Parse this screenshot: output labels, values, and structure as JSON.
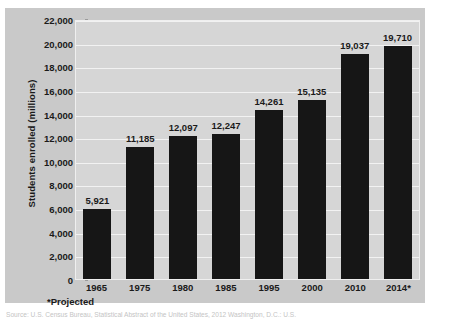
{
  "chart_data": {
    "type": "bar",
    "title": "",
    "xlabel": "",
    "ylabel": "Students enrolled (millions)",
    "categories": [
      "1965",
      "1975",
      "1980",
      "1985",
      "1995",
      "2000",
      "2010",
      "2014*"
    ],
    "values": [
      5921,
      11185,
      12097,
      12247,
      14261,
      15135,
      19037,
      19710
    ],
    "value_labels": [
      "5,921",
      "11,185",
      "12,097",
      "12,247",
      "14,261",
      "15,135",
      "19,037",
      "19,710"
    ],
    "ylim": [
      0,
      22000
    ],
    "ytick_labels": [
      "22,000",
      "20,000",
      "18,000",
      "16,000",
      "14,000",
      "12,000",
      "10,000",
      "8,000",
      "6,000",
      "4,000",
      "2,000",
      "0"
    ],
    "ytick_values": [
      22000,
      20000,
      18000,
      16000,
      14000,
      12000,
      10000,
      8000,
      6000,
      4000,
      2000,
      0
    ],
    "grid": true,
    "legend": "none",
    "bar_color": "#161616",
    "plot_background": "#d6d6d6",
    "panel_background": "#c9c9c9",
    "gridline_color": "#f2f2f2"
  },
  "footnote": "*Projected",
  "source": "Source: U.S. Census Bureau, Statistical Abstract of the United States, 2012 Washington, D.C.: U.S."
}
